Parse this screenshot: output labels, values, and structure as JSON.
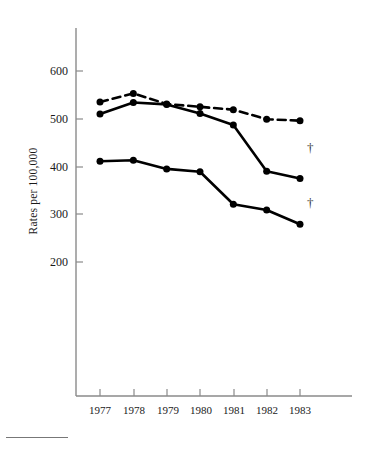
{
  "chart_data": {
    "type": "line",
    "title": "",
    "subtitle": "",
    "xlabel": "",
    "ylabel": "Rates per 100,000",
    "categories": [
      "1977",
      "1978",
      "1979",
      "1980",
      "1981",
      "1982",
      "1983"
    ],
    "x": [
      1977,
      1978,
      1979,
      1980,
      1981,
      1982,
      1983
    ],
    "xlim": [
      1976.4,
      1983.8
    ],
    "ylim": [
      100,
      640
    ],
    "yticks": [
      200,
      300,
      400,
      500,
      600
    ],
    "ytick_labels": [
      "200",
      "300",
      "400",
      "500",
      "600"
    ],
    "xtick_labels": [
      "1977",
      "1978",
      "1979",
      "1980",
      "1981",
      "1982",
      "1983"
    ],
    "grid": false,
    "legend": "none",
    "series": [
      {
        "name": "dashed-upper-series",
        "style": "dashed",
        "marker": "filled-circle",
        "color": "#000000",
        "values": [
          535,
          553,
          531,
          525,
          519,
          499,
          496
        ]
      },
      {
        "name": "solid-upper-series",
        "style": "solid",
        "marker": "filled-circle",
        "color": "#000000",
        "values": [
          510,
          534,
          530,
          511,
          487,
          390,
          375
        ],
        "end_annotation": "†"
      },
      {
        "name": "solid-lower-series",
        "style": "solid",
        "marker": "filled-circle",
        "color": "#000000",
        "values": [
          411,
          413,
          395,
          389,
          321,
          309,
          279
        ],
        "end_annotation": "†"
      }
    ],
    "annotations": [
      {
        "text": "†",
        "series": "solid-upper-series",
        "at_x": 1983
      },
      {
        "text": "†",
        "series": "solid-lower-series",
        "at_x": 1983
      }
    ]
  },
  "axis": {
    "y_title": "Rates per 100,000",
    "y_ticks": [
      "600",
      "500",
      "400",
      "300",
      "200"
    ],
    "x_ticks": [
      "1977",
      "1978",
      "1979",
      "1980",
      "1981",
      "1982",
      "1983"
    ]
  },
  "annotations": {
    "dagger_upper": "†",
    "dagger_lower": "†"
  },
  "colors": {
    "line": "#000000",
    "axis": "#8a8a8a",
    "text": "#1a1a1a",
    "background": "#ffffff"
  }
}
